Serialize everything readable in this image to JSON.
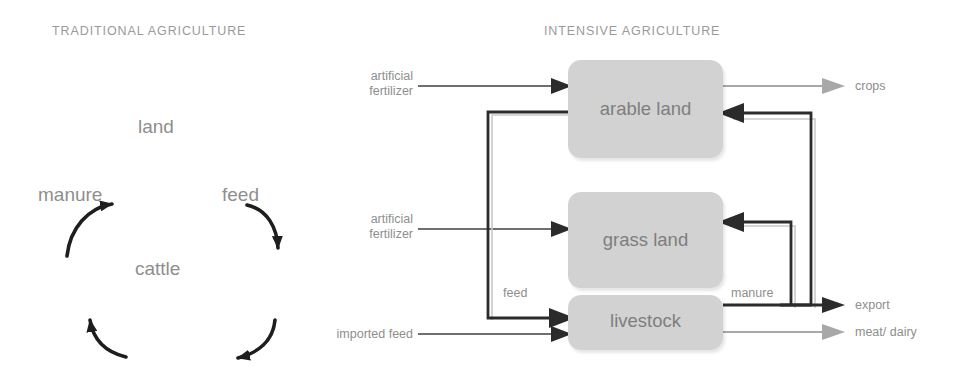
{
  "panels": {
    "left": {
      "title": "TRADITIONAL AGRICULTURE",
      "type": "cycle",
      "nodes": [
        {
          "id": "land",
          "label": "land"
        },
        {
          "id": "feed",
          "label": "feed"
        },
        {
          "id": "cattle",
          "label": "cattle"
        },
        {
          "id": "manure",
          "label": "manure"
        }
      ],
      "edges": [
        {
          "from": "land",
          "to": "feed",
          "style": "curved-arrow",
          "color": "#1e1e1e"
        },
        {
          "from": "feed",
          "to": "cattle",
          "style": "curved-arrow",
          "color": "#1e1e1e"
        },
        {
          "from": "cattle",
          "to": "manure",
          "style": "curved-arrow",
          "color": "#1e1e1e"
        },
        {
          "from": "manure",
          "to": "land",
          "style": "curved-arrow",
          "color": "#1e1e1e"
        }
      ]
    },
    "right": {
      "title": "INTENSIVE AGRICULTURE",
      "type": "flow",
      "boxes": [
        {
          "id": "arable-land",
          "label": "arable land"
        },
        {
          "id": "grass-land",
          "label": "grass land"
        },
        {
          "id": "livestock",
          "label": "livestock"
        }
      ],
      "inputs": [
        {
          "id": "artificial-fertilizer-arable",
          "line1": "artificial",
          "line2": "fertilizer",
          "target": "arable land"
        },
        {
          "id": "artificial-fertilizer-grass",
          "line1": "artificial",
          "line2": "fertilizer",
          "target": "grass land"
        },
        {
          "id": "imported-feed",
          "line1": "imported feed",
          "line2": "",
          "target": "livestock"
        }
      ],
      "outputs": [
        {
          "id": "crops",
          "label": "crops",
          "source": "arable land",
          "tone": "light"
        },
        {
          "id": "export",
          "label": "export",
          "source": "livestock",
          "tone": "dark"
        },
        {
          "id": "meat-dairy",
          "label": "meat/ dairy",
          "source": "livestock",
          "tone": "light"
        }
      ],
      "edge_labels": [
        {
          "id": "feed",
          "label": "feed",
          "from": "arable land",
          "to": "livestock"
        },
        {
          "id": "manure",
          "label": "manure",
          "from": "livestock",
          "to": "grass land / arable land"
        }
      ]
    }
  },
  "colors": {
    "box_fill": "#d2d2d2",
    "box_text": "#7e7e7e",
    "title_text": "#9a9a9a",
    "label_text": "#8e8e8e",
    "dark_arrow": "#2b2b2b",
    "light_arrow": "#a8a8a8",
    "background": "#ffffff"
  }
}
